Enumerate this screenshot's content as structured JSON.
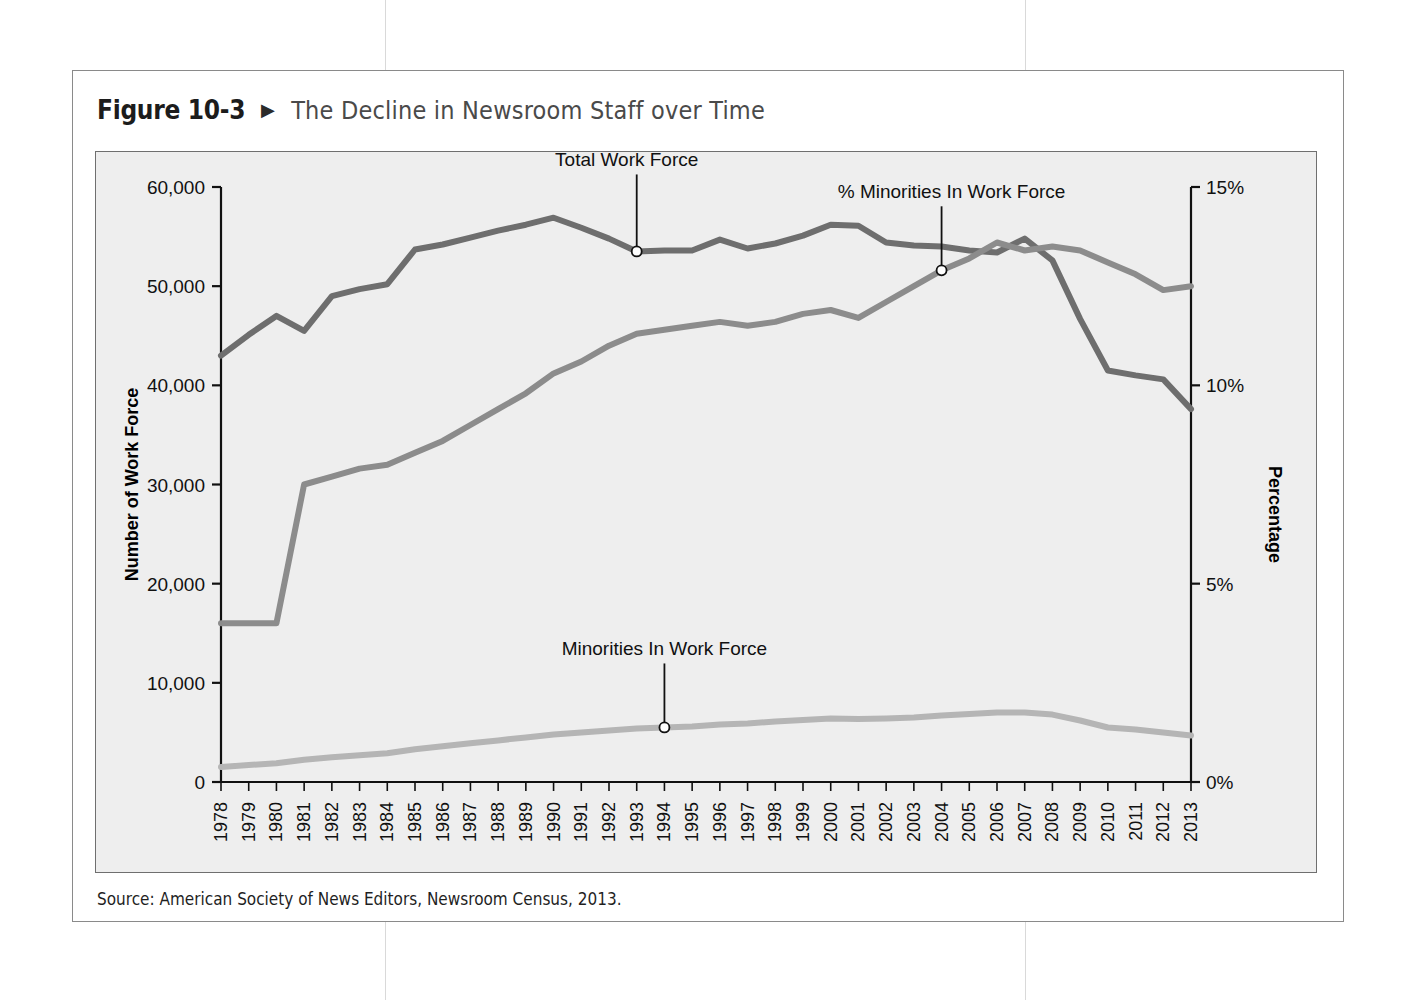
{
  "figure": {
    "number": "Figure 10-3",
    "arrow": "▶",
    "title": "The Decline in Newsroom Staff over Time",
    "source": "Source: American Society of News Editors, Newsroom Census, 2013."
  },
  "colors": {
    "total_line": "#6e6e6e",
    "pct_line": "#8c8c8c",
    "minorities_line": "#b5b5b5",
    "panel_bg": "#eeeeee",
    "axis": "#111111",
    "title_text": "#4a4a4a"
  },
  "chart_data": {
    "type": "line",
    "title": "The Decline in Newsroom Staff over Time",
    "xlabel": "Year",
    "ylabel": "Number of Work Force",
    "y2label": "Percentage",
    "ylim": [
      0,
      60000
    ],
    "y2lim": [
      0,
      15
    ],
    "grid": false,
    "legend": "annotations-on-plot",
    "yticks": [
      "0",
      "10,000",
      "20,000",
      "30,000",
      "40,000",
      "50,000",
      "60,000"
    ],
    "ytick_values": [
      0,
      10000,
      20000,
      30000,
      40000,
      50000,
      60000
    ],
    "y2ticks": [
      "0%",
      "5%",
      "10%",
      "15%"
    ],
    "y2tick_values": [
      0,
      5,
      10,
      15
    ],
    "categories": [
      "1978",
      "1979",
      "1980",
      "1981",
      "1982",
      "1983",
      "1984",
      "1985",
      "1986",
      "1987",
      "1988",
      "1989",
      "1990",
      "1991",
      "1992",
      "1993",
      "1994",
      "1995",
      "1996",
      "1997",
      "1998",
      "1999",
      "2000",
      "2001",
      "2002",
      "2003",
      "2004",
      "2005",
      "2006",
      "2007",
      "2008",
      "2009",
      "2010",
      "2011",
      "2012",
      "2013"
    ],
    "series": [
      {
        "name": "Total Work Force",
        "axis": "left",
        "color": "#6e6e6e",
        "values": [
          43000,
          45100,
          47000,
          45500,
          49000,
          49700,
          50200,
          53700,
          54200,
          54900,
          55600,
          56200,
          56900,
          55900,
          54800,
          53500,
          53600,
          53600,
          54700,
          53800,
          54300,
          55100,
          56200,
          56100,
          54400,
          54100,
          54000,
          53600,
          53400,
          54800,
          52600,
          46700,
          41500,
          41000,
          40600,
          37600
        ]
      },
      {
        "name": "% Minorities In Work Force",
        "axis": "right",
        "color": "#8c8c8c",
        "values": [
          4.0,
          4.0,
          4.0,
          7.5,
          7.7,
          7.9,
          8.0,
          8.3,
          8.6,
          9.0,
          9.4,
          9.8,
          10.3,
          10.6,
          11.0,
          11.3,
          11.4,
          11.5,
          11.6,
          11.5,
          11.6,
          11.8,
          11.9,
          11.7,
          12.1,
          12.5,
          12.9,
          13.2,
          13.6,
          13.4,
          13.5,
          13.4,
          13.1,
          12.8,
          12.4,
          12.5
        ]
      },
      {
        "name": "Minorities In Work Force",
        "axis": "left",
        "color": "#b5b5b5",
        "values": [
          1500,
          1700,
          1900,
          2250,
          2500,
          2700,
          2900,
          3300,
          3600,
          3900,
          4200,
          4500,
          4800,
          5000,
          5200,
          5400,
          5500,
          5600,
          5800,
          5900,
          6100,
          6250,
          6400,
          6350,
          6400,
          6500,
          6700,
          6850,
          7000,
          7000,
          6800,
          6200,
          5500,
          5300,
          5000,
          4700
        ]
      }
    ],
    "annotations": [
      {
        "text": "Total Work Force",
        "series": "Total Work Force",
        "year": "1993",
        "value": 53500
      },
      {
        "text": "% Minorities In Work Force",
        "series": "% Minorities In Work Force",
        "year": "2004",
        "value": 12.9
      },
      {
        "text": "Minorities In Work Force",
        "series": "Minorities In Work Force",
        "year": "1994",
        "value": 5500
      }
    ]
  }
}
